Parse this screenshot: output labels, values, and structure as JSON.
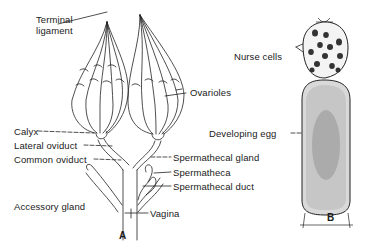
{
  "figure_a": {
    "caption": "A",
    "labels": {
      "terminal_ligament_line1": "Terminal",
      "terminal_ligament_line2": "ligament",
      "ovarioles": "Ovarioles",
      "calyx": "Calyx",
      "lateral_oviduct": "Lateral oviduct",
      "common_oviduct": "Common oviduct",
      "spermathecal_gland": "Spermathecal gland",
      "spermatheca": "Spermatheca",
      "spermathecal_duct": "Spermathecal duct",
      "accessory_gland": "Accessory gland",
      "vagina": "Vagina"
    }
  },
  "figure_b": {
    "caption": "B",
    "labels": {
      "nurse_cells": "Nurse cells",
      "developing_egg": "Developing egg"
    }
  },
  "colors": {
    "ink": "#1a1a1a",
    "background": "#ffffff"
  }
}
